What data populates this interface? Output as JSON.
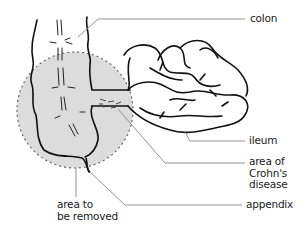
{
  "diagram": {
    "labels": {
      "colon": "colon",
      "ileum": "ileum",
      "crohns": [
        "area of",
        "Crohn's",
        "disease"
      ],
      "appendix": "appendix",
      "removed": [
        "area to",
        "be removed"
      ]
    },
    "colors": {
      "outline": "#111111",
      "removal_zone_fill": "#dcdcdc",
      "removal_zone_border": "#666666",
      "leader_line": "#888888"
    }
  }
}
